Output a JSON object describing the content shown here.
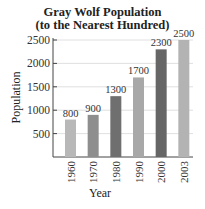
{
  "chart_data": {
    "type": "bar",
    "title": "Gray Wolf Population",
    "subtitle": "(to the Nearest Hundred)",
    "xlabel": "Year",
    "ylabel": "Population",
    "categories": [
      "1960",
      "1970",
      "1980",
      "1990",
      "2000",
      "2003"
    ],
    "values": [
      800,
      900,
      1300,
      1700,
      2300,
      2500
    ],
    "data_labels": [
      "800",
      "900",
      "1300",
      "1700",
      "2300",
      "2500"
    ],
    "bar_colors": [
      "#b8b8b8",
      "#8e8e8e",
      "#6f6f6f",
      "#a8a8a8",
      "#666666",
      "#b3b3b3"
    ],
    "ylim": [
      0,
      2500
    ],
    "yticks": [
      500,
      1000,
      1500,
      2000,
      2500
    ],
    "grid": true,
    "legend": null
  }
}
